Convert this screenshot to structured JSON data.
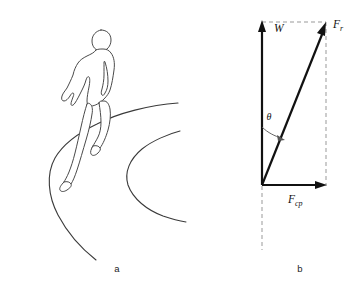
{
  "figure": {
    "background_color": "#ffffff",
    "line_color": "#3a3a3a",
    "vector_color": "#111111",
    "dashed_color": "#999999",
    "panels": [
      {
        "key": "a",
        "label": "a",
        "caption": "runner on curved track"
      },
      {
        "key": "b",
        "label": "b",
        "caption": "force vector diagram"
      }
    ]
  },
  "panel_a": {
    "label": "a",
    "subject": "runner-figure",
    "track": {
      "outer_curve_name": "track-outer-curve",
      "inner_curve_name": "track-inner-curve"
    }
  },
  "panel_b": {
    "label": "b",
    "vectors": [
      {
        "name": "weight-vector",
        "label": "W",
        "sub": "",
        "direction": "up",
        "from": [
          262,
          185
        ],
        "to": [
          262,
          22
        ]
      },
      {
        "name": "resultant-force-vector",
        "label": "F",
        "sub": "r",
        "direction": "up-right",
        "from": [
          262,
          185
        ],
        "to": [
          325,
          24
        ]
      },
      {
        "name": "centripetal-force-vector",
        "label": "F",
        "sub": "cp",
        "direction": "right",
        "from": [
          262,
          185
        ],
        "to": [
          327,
          185
        ]
      }
    ],
    "angle": {
      "name": "theta-angle",
      "symbol": "θ",
      "between": [
        "weight-vector",
        "resultant-force-vector"
      ]
    },
    "construction_lines": [
      {
        "name": "top-dashed-line",
        "style": "dashed"
      },
      {
        "name": "right-dashed-line",
        "style": "dashed"
      },
      {
        "name": "bottom-dashed-line",
        "style": "dashed"
      }
    ]
  }
}
